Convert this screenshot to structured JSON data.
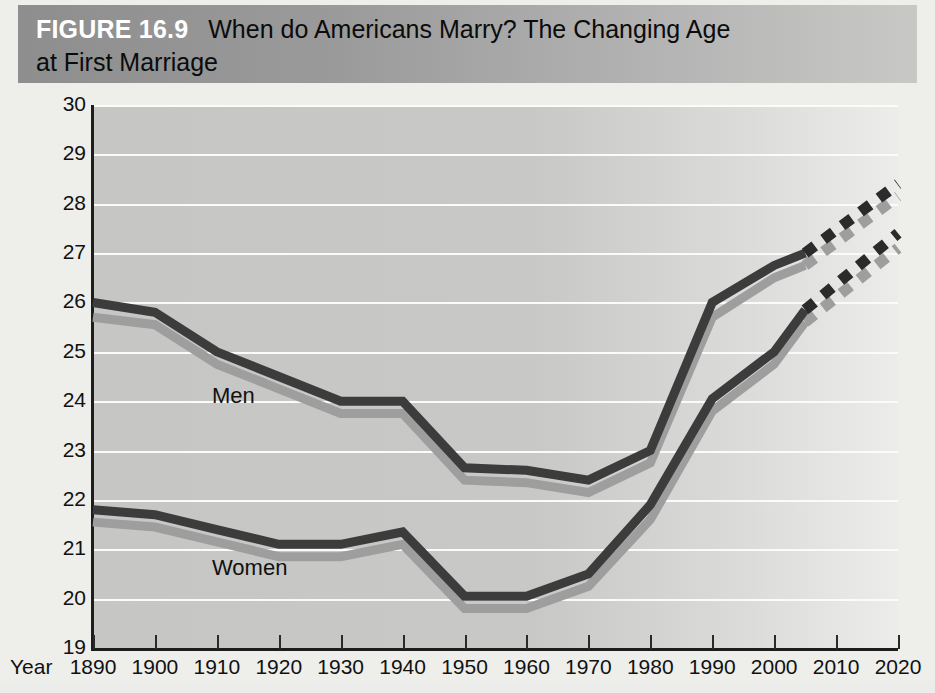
{
  "figure": {
    "number_label": "FIGURE 16.9",
    "title_line1": "When do Americans Marry? The Changing Age",
    "title_line2": "at First Marriage",
    "banner_color_left": "#8e8e8e",
    "banner_color_right": "#c8c8c6",
    "page_background": "#eeeeeb",
    "plot_background": "#c8c8c6",
    "gridline_color": "#fbfbfa"
  },
  "axes": {
    "y_title": "Age",
    "x_title": "Year",
    "y_ticks": [
      30,
      29,
      28,
      27,
      26,
      25,
      24,
      23,
      22,
      21,
      20,
      19
    ],
    "x_ticks": [
      1890,
      1900,
      1910,
      1920,
      1930,
      1940,
      1950,
      1960,
      1970,
      1980,
      1990,
      2000,
      2010,
      2020
    ]
  },
  "series_labels": {
    "men": "Men",
    "women": "Women"
  },
  "chart_data": {
    "type": "line",
    "title": "When do Americans Marry? The Changing Age at First Marriage",
    "xlabel": "Year",
    "ylabel": "Age",
    "xlim": [
      1890,
      2020
    ],
    "ylim": [
      19,
      30
    ],
    "grid": true,
    "legend": "inline-labels",
    "x": [
      1890,
      1900,
      1910,
      1920,
      1930,
      1940,
      1950,
      1960,
      1970,
      1980,
      1990,
      2000,
      2005
    ],
    "series": [
      {
        "name": "Men",
        "color": "#3c3c3c",
        "style": "solid",
        "values": [
          26.0,
          25.8,
          25.0,
          24.5,
          24.0,
          24.0,
          22.65,
          22.6,
          22.4,
          23.0,
          26.0,
          26.75,
          27.0
        ]
      },
      {
        "name": "Women",
        "color": "#3c3c3c",
        "style": "solid",
        "values": [
          21.8,
          21.7,
          21.4,
          21.1,
          21.1,
          21.35,
          20.05,
          20.05,
          20.5,
          21.9,
          24.05,
          25.0,
          25.85
        ]
      }
    ],
    "projections": [
      {
        "name": "Men projected",
        "color": "#2b2b2b",
        "style": "dashed",
        "x": [
          2005,
          2020
        ],
        "values": [
          27.0,
          28.4
        ]
      },
      {
        "name": "Women projected",
        "color": "#2b2b2b",
        "style": "dashed",
        "x": [
          2005,
          2020
        ],
        "values": [
          25.85,
          27.4
        ]
      }
    ],
    "shadow_series": [
      {
        "name": "Men shadow",
        "color": "#9e9e9e",
        "style": "solid",
        "x": [
          1890,
          1900,
          1910,
          1920,
          1930,
          1940,
          1950,
          1960,
          1970,
          1980,
          1990,
          2000,
          2005
        ],
        "values": [
          25.7,
          25.55,
          24.75,
          24.25,
          23.75,
          23.75,
          22.4,
          22.35,
          22.15,
          22.75,
          25.7,
          26.5,
          26.75
        ]
      },
      {
        "name": "Women shadow",
        "color": "#9e9e9e",
        "style": "solid",
        "x": [
          1890,
          1900,
          1910,
          1920,
          1930,
          1940,
          1950,
          1960,
          1970,
          1980,
          1990,
          2000,
          2005
        ],
        "values": [
          21.55,
          21.45,
          21.15,
          20.85,
          20.85,
          21.1,
          19.8,
          19.8,
          20.25,
          21.6,
          23.8,
          24.75,
          25.6
        ]
      },
      {
        "name": "Men projected shadow",
        "color": "#9e9e9e",
        "style": "dashed",
        "x": [
          2005,
          2020
        ],
        "values": [
          26.75,
          28.15
        ]
      },
      {
        "name": "Women projected shadow",
        "color": "#9e9e9e",
        "style": "dashed",
        "x": [
          2005,
          2020
        ],
        "values": [
          25.6,
          27.1
        ]
      }
    ]
  }
}
